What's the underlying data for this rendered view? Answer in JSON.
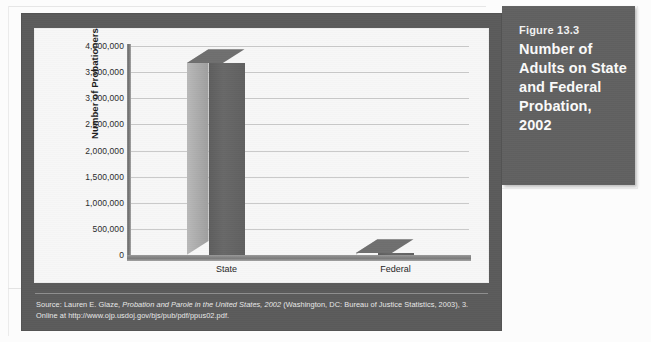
{
  "caption": {
    "figure_number": "Figure 13.3",
    "title": "Number of Adults on State and Federal Probation, 2002",
    "background_color": "#616161",
    "text_color": "#fbfbfb"
  },
  "panel": {
    "background_color": "#5b5b5b"
  },
  "source": {
    "prefix": "Source: Lauren E. Glaze, ",
    "italic_title": "Probation and Parole in the United States, 2002",
    "suffix": " (Washington, DC: Bureau of Justice Statistics, 2003), 3.",
    "online_line": "Online at http://www.ojp.usdoj.gov/bjs/pub/pdf/ppus02.pdf."
  },
  "chart_data": {
    "type": "bar",
    "title": "",
    "categories": [
      "State",
      "Federal"
    ],
    "values": [
      3670000,
      32000
    ],
    "xlabel": "",
    "ylabel": "Number of Probationers",
    "ylim": [
      0,
      4000000
    ],
    "ytick_labels": [
      "4,000,000",
      "3,500,000",
      "3,000,000",
      "2,500,000",
      "2,000,000",
      "1,500,000",
      "1,000,000",
      "500,000",
      "0"
    ],
    "ytick_values": [
      4000000,
      3500000,
      3000000,
      2500000,
      2000000,
      1500000,
      1000000,
      500000,
      0
    ],
    "grid": true,
    "grid_orientation": "horizontal",
    "legend": false,
    "legend_position": "none",
    "style": "3d-column",
    "bar_face_color": "#636363",
    "bar_side_color": "#ababab",
    "plot_background_color": "#f7f7f7"
  }
}
